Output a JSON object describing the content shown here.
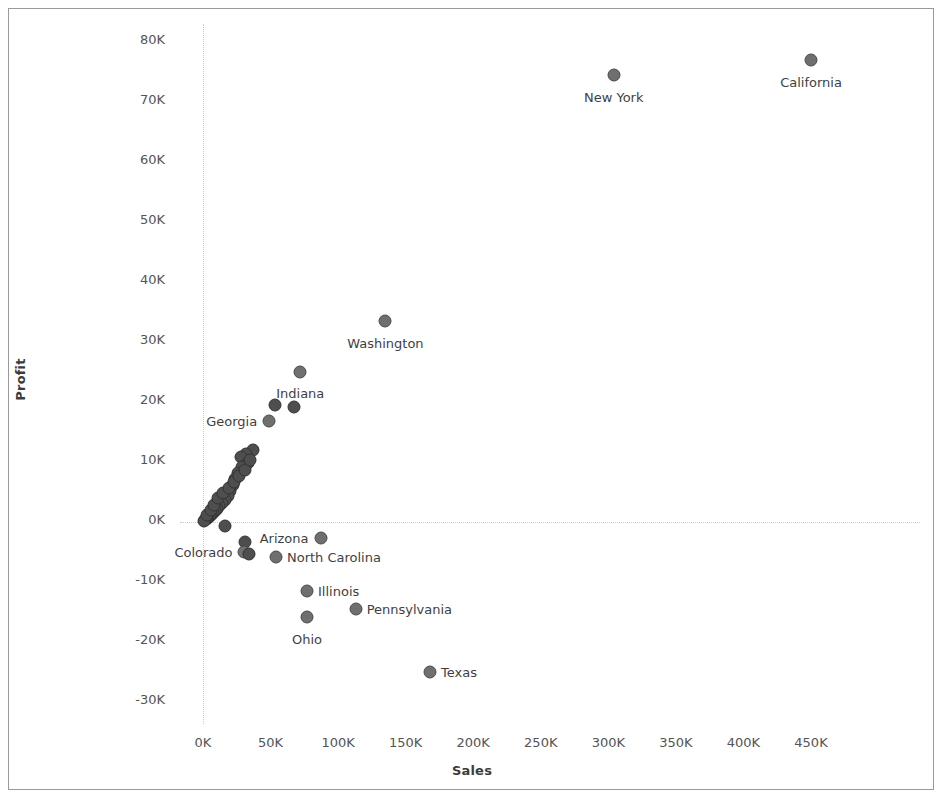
{
  "chart_data": {
    "type": "scatter",
    "title": "",
    "xlabel": "Sales",
    "ylabel": "Profit",
    "xlim": [
      0,
      470000
    ],
    "ylim": [
      -32000,
      82000
    ],
    "xticks": [
      "0K",
      "50K",
      "100K",
      "150K",
      "200K",
      "250K",
      "300K",
      "350K",
      "400K",
      "450K"
    ],
    "xtick_values": [
      0,
      50000,
      100000,
      150000,
      200000,
      250000,
      300000,
      350000,
      400000,
      450000
    ],
    "yticks": [
      "80K",
      "70K",
      "60K",
      "50K",
      "40K",
      "30K",
      "20K",
      "10K",
      "0K",
      "-10K",
      "-20K",
      "-30K"
    ],
    "ytick_values": [
      80000,
      70000,
      60000,
      50000,
      40000,
      30000,
      20000,
      10000,
      0,
      -10000,
      -20000,
      -30000
    ],
    "grid": false,
    "zero_reference_lines": true,
    "legend": "none",
    "marker_color": "#6f6f6f",
    "marker_border_color": "#4a4a4a",
    "points": [
      {
        "label": "California",
        "x": 450000,
        "y": 76500,
        "lx": "ctr",
        "ldx": 0,
        "ldy": 22
      },
      {
        "label": "New York",
        "x": 304000,
        "y": 74000,
        "lx": "ctr",
        "ldx": 0,
        "ldy": 22
      },
      {
        "label": "Washington",
        "x": 135000,
        "y": 33000,
        "lx": "ctr",
        "ldx": 0,
        "ldy": 22
      },
      {
        "label": "Indiana",
        "x": 72000,
        "y": 24500,
        "lx": "ctr",
        "ldx": 0,
        "ldy": 21
      },
      {
        "label": "",
        "x": 53000,
        "y": 19000,
        "lx": "ctr",
        "ldx": 0,
        "ldy": 0
      },
      {
        "label": "",
        "x": 67000,
        "y": 18700,
        "lx": "ctr",
        "ldx": 0,
        "ldy": 0
      },
      {
        "label": "Georgia",
        "x": 49000,
        "y": 16300,
        "lx": "lft",
        "ldx": -12,
        "ldy": 0
      },
      {
        "label": "",
        "x": 37000,
        "y": 11500,
        "lx": "ctr",
        "ldx": 0,
        "ldy": 0
      },
      {
        "label": "",
        "x": 32000,
        "y": 10800,
        "lx": "ctr",
        "ldx": 0,
        "ldy": 0
      },
      {
        "label": "",
        "x": 28000,
        "y": 10300,
        "lx": "ctr",
        "ldx": 0,
        "ldy": 0
      },
      {
        "label": "",
        "x": 33000,
        "y": 9300,
        "lx": "ctr",
        "ldx": 0,
        "ldy": 0
      },
      {
        "label": "",
        "x": 29000,
        "y": 8600,
        "lx": "ctr",
        "ldx": 0,
        "ldy": 0
      },
      {
        "label": "",
        "x": 26000,
        "y": 7600,
        "lx": "ctr",
        "ldx": 0,
        "ldy": 0
      },
      {
        "label": "",
        "x": 24000,
        "y": 6600,
        "lx": "ctr",
        "ldx": 0,
        "ldy": 0
      },
      {
        "label": "",
        "x": 22000,
        "y": 5600,
        "lx": "ctr",
        "ldx": 0,
        "ldy": 0
      },
      {
        "label": "",
        "x": 20000,
        "y": 4600,
        "lx": "ctr",
        "ldx": 0,
        "ldy": 0
      },
      {
        "label": "",
        "x": 18500,
        "y": 3900,
        "lx": "ctr",
        "ldx": 0,
        "ldy": 0
      },
      {
        "label": "",
        "x": 16000,
        "y": 3200,
        "lx": "ctr",
        "ldx": 0,
        "ldy": 0
      },
      {
        "label": "",
        "x": 14000,
        "y": 2600,
        "lx": "ctr",
        "ldx": 0,
        "ldy": 0
      },
      {
        "label": "",
        "x": 12000,
        "y": 2100,
        "lx": "ctr",
        "ldx": 0,
        "ldy": 0
      },
      {
        "label": "",
        "x": 10500,
        "y": 1700,
        "lx": "ctr",
        "ldx": 0,
        "ldy": 0
      },
      {
        "label": "",
        "x": 9000,
        "y": 1300,
        "lx": "ctr",
        "ldx": 0,
        "ldy": 0
      },
      {
        "label": "",
        "x": 7500,
        "y": 950,
        "lx": "ctr",
        "ldx": 0,
        "ldy": 0
      },
      {
        "label": "",
        "x": 6200,
        "y": 700,
        "lx": "ctr",
        "ldx": 0,
        "ldy": 0
      },
      {
        "label": "",
        "x": 5000,
        "y": 450,
        "lx": "ctr",
        "ldx": 0,
        "ldy": 0
      },
      {
        "label": "",
        "x": 4000,
        "y": 250,
        "lx": "ctr",
        "ldx": 0,
        "ldy": 0
      },
      {
        "label": "",
        "x": 3000,
        "y": 100,
        "lx": "ctr",
        "ldx": 0,
        "ldy": 0
      },
      {
        "label": "",
        "x": 2200,
        "y": -50,
        "lx": "ctr",
        "ldx": 0,
        "ldy": 0
      },
      {
        "label": "",
        "x": 1500,
        "y": -150,
        "lx": "ctr",
        "ldx": 0,
        "ldy": 0
      },
      {
        "label": "",
        "x": 900,
        "y": -250,
        "lx": "ctr",
        "ldx": 0,
        "ldy": 0
      },
      {
        "label": "",
        "x": 2600,
        "y": 600,
        "lx": "ctr",
        "ldx": 0,
        "ldy": 0
      },
      {
        "label": "",
        "x": 5600,
        "y": 1500,
        "lx": "ctr",
        "ldx": 0,
        "ldy": 0
      },
      {
        "label": "",
        "x": 8200,
        "y": 2300,
        "lx": "ctr",
        "ldx": 0,
        "ldy": 0
      },
      {
        "label": "",
        "x": 11000,
        "y": 3500,
        "lx": "ctr",
        "ldx": 0,
        "ldy": 0
      },
      {
        "label": "",
        "x": 15000,
        "y": 4300,
        "lx": "ctr",
        "ldx": 0,
        "ldy": 0
      },
      {
        "label": "",
        "x": 19000,
        "y": 5200,
        "lx": "ctr",
        "ldx": 0,
        "ldy": 0
      },
      {
        "label": "",
        "x": 23000,
        "y": 6100,
        "lx": "ctr",
        "ldx": 0,
        "ldy": 0
      },
      {
        "label": "",
        "x": 27000,
        "y": 7100,
        "lx": "ctr",
        "ldx": 0,
        "ldy": 0
      },
      {
        "label": "",
        "x": 31000,
        "y": 8100,
        "lx": "ctr",
        "ldx": 0,
        "ldy": 0
      },
      {
        "label": "",
        "x": 35000,
        "y": 9800,
        "lx": "ctr",
        "ldx": 0,
        "ldy": 0
      },
      {
        "label": "",
        "x": 16500,
        "y": -1200,
        "lx": "ctr",
        "ldx": 0,
        "ldy": 0
      },
      {
        "label": "Arizona",
        "x": 87000,
        "y": -3100,
        "lx": "lft",
        "ldx": -12,
        "ldy": 0
      },
      {
        "label": "",
        "x": 31000,
        "y": -3900,
        "lx": "ctr",
        "ldx": 0,
        "ldy": 0
      },
      {
        "label": "Colorado",
        "x": 30000,
        "y": -5500,
        "lx": "lft",
        "ldx": -11,
        "ldy": 0
      },
      {
        "label": "",
        "x": 34000,
        "y": -5900,
        "lx": "ctr",
        "ldx": 0,
        "ldy": 0
      },
      {
        "label": "North Carolina",
        "x": 54000,
        "y": -6400,
        "lx": "rgt",
        "ldx": 11,
        "ldy": 0
      },
      {
        "label": "Illinois",
        "x": 77000,
        "y": -12000,
        "lx": "rgt",
        "ldx": 11,
        "ldy": 0
      },
      {
        "label": "Pennsylvania",
        "x": 113000,
        "y": -15000,
        "lx": "rgt",
        "ldx": 11,
        "ldy": 0
      },
      {
        "label": "Ohio",
        "x": 77000,
        "y": -16300,
        "lx": "ctr",
        "ldx": 0,
        "ldy": 22
      },
      {
        "label": "Texas",
        "x": 168000,
        "y": -25500,
        "lx": "rgt",
        "ldx": 11,
        "ldy": 0
      }
    ]
  }
}
